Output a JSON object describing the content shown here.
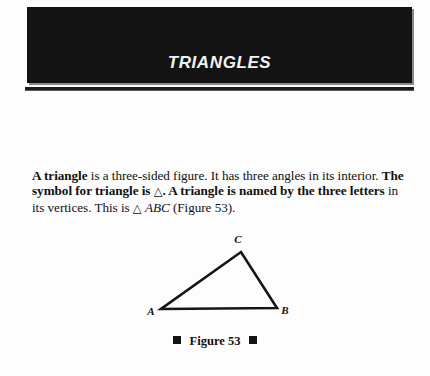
{
  "page": {
    "background_color": "#fdfdfd",
    "text_color": "#111111"
  },
  "header": {
    "title": "TRIANGLES",
    "banner_color": "#131313",
    "title_color": "#f2f2f2",
    "rule_color": "#1b1b1b"
  },
  "body": {
    "line1_bold_lead": "A triangle",
    "line1_rest": " is a three-sided figure. It has three angles in its interior.",
    "line2_part1": "The symbol for triangle is ",
    "line2_symbol": "△",
    "line2_part2": ". A triangle is named by the three letters",
    "line3_part1": "in its vertices. This is ",
    "line3_symbol": "△",
    "line3_italic": "ABC",
    "line3_part2": " (Figure 53)."
  },
  "figure": {
    "caption": "Figure 53",
    "caption_marker": "square-bullet",
    "stroke_color": "#151515",
    "vertices": [
      {
        "label": "A",
        "x": 21,
        "y": 81,
        "label_x": 11,
        "label_y": 87
      },
      {
        "label": "B",
        "x": 137,
        "y": 80,
        "label_x": 145,
        "label_y": 86
      },
      {
        "label": "C",
        "x": 101,
        "y": 24,
        "label_x": 98,
        "label_y": 15
      }
    ]
  }
}
